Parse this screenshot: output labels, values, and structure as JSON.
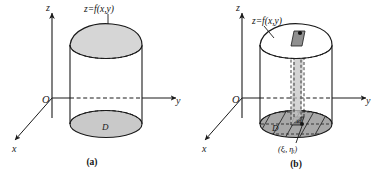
{
  "figure": {
    "panels": [
      {
        "id": "a",
        "caption": "(a)",
        "axes": {
          "z": "z",
          "y": "y",
          "x": "x",
          "origin": "O"
        },
        "labels": {
          "surface": "z=f(x,y)",
          "region": "D"
        },
        "colors": {
          "stroke": "#1a1a1a",
          "top_fill": "#d6d6d6",
          "base_fill": "#c9c9c9",
          "body_fill": "#ffffff"
        }
      },
      {
        "id": "b",
        "caption": "(b)",
        "axes": {
          "z": "z",
          "y": "y",
          "x": "x",
          "origin": "O"
        },
        "labels": {
          "surface": "z=f(x,y)",
          "region": "D",
          "cell": "Δσ",
          "sample_point": "(ξᵢ, ηᵢ)"
        },
        "colors": {
          "stroke": "#1a1a1a",
          "top_fill": "#ffffff",
          "base_fill": "#a8a8a8",
          "prism_fill": "#c6c6c6",
          "cap_patch_fill": "#8f8f8f",
          "cell_fill": "#7e7e7e",
          "dot_fill": "#111111"
        }
      }
    ]
  }
}
